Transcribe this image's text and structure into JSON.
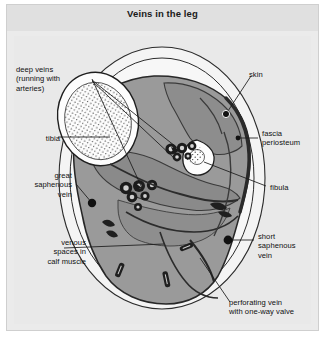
{
  "figure": {
    "title": "Veins in the leg",
    "caption_position": "top"
  },
  "colors": {
    "panel_background": "#ebebeb",
    "title_strip": "#e0e0e0",
    "art_background": "#e9e9e9",
    "skin_layer": "#f2f2f2",
    "fascia_outline": "#2b2b2b",
    "muscle_fill": "#9a9a9a",
    "deep_muscle_fill": "#8a8a8a",
    "bone_fill": "#fdfdfd",
    "vessel_dark": "#1c1c1c",
    "leader_line": "#1a1a1a",
    "marker_dot": "#111111",
    "text": "#101010"
  },
  "labels": {
    "deep_veins": {
      "text": "deep veins\n(running with\narteries)",
      "align": "left",
      "x": 16,
      "y": 65
    },
    "tibia": {
      "text": "tibia",
      "align": "right",
      "x": 30,
      "y": 134
    },
    "great_saphenous_vein": {
      "text": "great\nsaphenous\nvein",
      "align": "right",
      "x": 18,
      "y": 171
    },
    "venous_spaces": {
      "text": "venous\nspaces in\ncalf muscle",
      "align": "right",
      "x": 14,
      "y": 238
    },
    "skin": {
      "text": "skin",
      "align": "left",
      "x": 249,
      "y": 70
    },
    "fascia_periosteum": {
      "text": "fascia\nperiosteum",
      "align": "left",
      "x": 262,
      "y": 129
    },
    "fibula": {
      "text": "fibula",
      "align": "left",
      "x": 270,
      "y": 183
    },
    "short_saphenous_vein": {
      "text": "short\nsaphenous\nvein",
      "align": "left",
      "x": 258,
      "y": 232
    },
    "perforating_vein": {
      "text": "perforating vein\nwith one-way valve",
      "align": "left",
      "x": 229,
      "y": 298
    }
  },
  "anatomy": {
    "structures": [
      "skin",
      "fascia periosteum",
      "tibia",
      "fibula",
      "deep veins running with arteries",
      "great saphenous vein",
      "short saphenous vein",
      "perforating vein with one-way valve",
      "venous spaces in calf muscle"
    ],
    "view": "cross-section of the lower leg"
  }
}
